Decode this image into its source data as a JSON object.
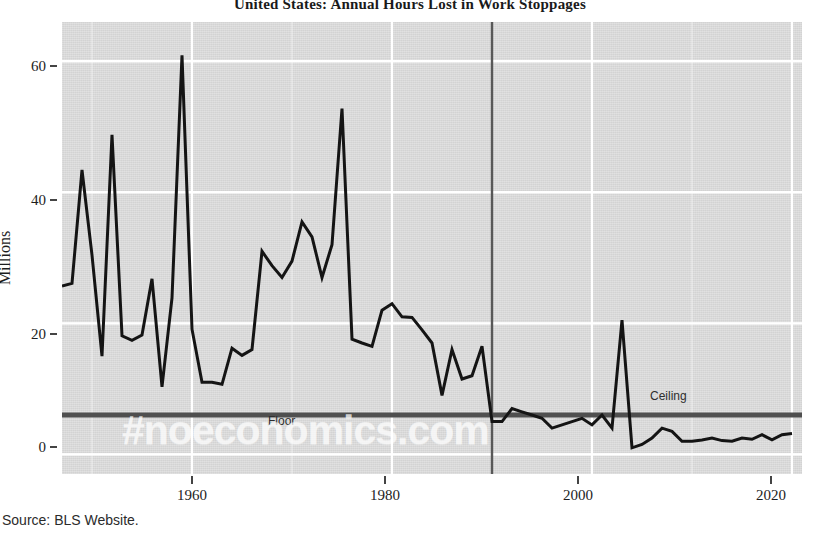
{
  "title": "United States: Annual Hours Lost in Work Stoppages",
  "caption": "Source: BLS Website.",
  "watermark": "#noeconomics.com",
  "axes": {
    "y_label": "Millions",
    "y_ticks": [
      "0",
      "20",
      "40",
      "60"
    ],
    "x_ticks": [
      "1960",
      "1980",
      "2000",
      "2020"
    ]
  },
  "annotations": {
    "ceiling": "Ceiling",
    "floor": "Floor"
  },
  "colors": {
    "line": "#141414",
    "reference_line": "#4f4f4f",
    "vertical_marker": "#555555",
    "panel": "#d9d9d9",
    "grid": "#ffffff",
    "text": "#1d1d1d"
  },
  "chart_data": {
    "type": "line",
    "title": "United States: Annual Hours Lost in Work Stoppages",
    "xlabel": "",
    "ylabel": "Millions",
    "xlim": [
      1947,
      2021
    ],
    "ylim": [
      -3,
      66
    ],
    "grid": true,
    "legend": null,
    "x_ticks": [
      1960,
      1980,
      2000,
      2020
    ],
    "y_ticks": [
      0,
      20,
      40,
      60
    ],
    "series": [
      {
        "name": "Hours lost in work stoppages (millions)",
        "x": [
          1947,
          1948,
          1949,
          1950,
          1951,
          1952,
          1953,
          1954,
          1955,
          1956,
          1957,
          1958,
          1959,
          1960,
          1961,
          1962,
          1963,
          1964,
          1965,
          1966,
          1967,
          1968,
          1969,
          1970,
          1971,
          1972,
          1973,
          1974,
          1975,
          1976,
          1977,
          1978,
          1979,
          1980,
          1981,
          1982,
          1983,
          1984,
          1985,
          1986,
          1987,
          1988,
          1989,
          1990,
          1991,
          1992,
          1993,
          1994,
          1995,
          1996,
          1997,
          1998,
          1999,
          2000,
          2001,
          2002,
          2003,
          2004,
          2005,
          2006,
          2007,
          2008,
          2009,
          2010,
          2011,
          2012,
          2013,
          2014,
          2015,
          2016,
          2017,
          2018,
          2019,
          2020
        ],
        "y": [
          25.7,
          26.1,
          43.4,
          30.4,
          15.0,
          48.8,
          18.1,
          17.4,
          18.2,
          26.8,
          10.3,
          23.9,
          60.9,
          19.1,
          11.0,
          11.0,
          10.7,
          16.2,
          15.1,
          16.0,
          31.0,
          28.8,
          27.0,
          29.5,
          35.5,
          33.2,
          27.0,
          32.0,
          52.8,
          17.6,
          17.0,
          16.5,
          22.0,
          23.0,
          21.0,
          20.9,
          19.0,
          17.0,
          9.0,
          16.0,
          11.5,
          12.0,
          16.5,
          5.0,
          5.0,
          7.0,
          6.5,
          6.0,
          5.5,
          4.0,
          4.5,
          5.0,
          5.5,
          4.5,
          6.0,
          4.0,
          20.5,
          1.0,
          1.5,
          2.5,
          4.0,
          3.5,
          2.0,
          2.0,
          2.2,
          2.5,
          2.1,
          2.0,
          2.5,
          2.3,
          3.0,
          2.2,
          3.0,
          3.2
        ]
      },
      {
        "name": "Reference line (Ceiling / Floor)",
        "type": "hline",
        "value": 6.0
      },
      {
        "name": "Vertical marker",
        "type": "vline",
        "value": 1990
      }
    ]
  }
}
